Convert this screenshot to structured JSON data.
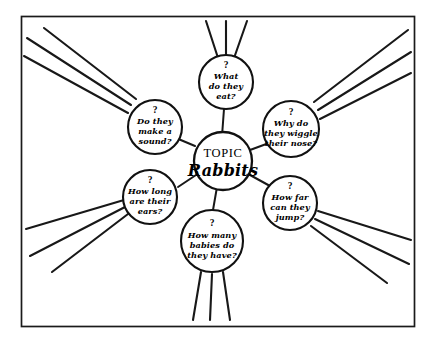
{
  "diagram": {
    "type": "spider-map",
    "frame": {
      "border_color": "#1a1a1a",
      "background": "#ffffff"
    },
    "ink_color": "#111111",
    "center": {
      "label": "TOPIC",
      "value": "Rabbits"
    },
    "question_marker": "?",
    "branches": [
      {
        "id": "top",
        "question_marker": "?",
        "lines": [
          "What",
          "do they",
          "eat?"
        ],
        "ray_count": 3
      },
      {
        "id": "upper-left",
        "question_marker": "?",
        "lines": [
          "Do they",
          "make a",
          "sound?"
        ],
        "ray_count": 3
      },
      {
        "id": "upper-right",
        "question_marker": "?",
        "lines": [
          "Why do",
          "they wiggle",
          "their nose?"
        ],
        "ray_count": 3
      },
      {
        "id": "lower-left",
        "question_marker": "?",
        "lines": [
          "How long",
          "are their",
          "ears?"
        ],
        "ray_count": 3
      },
      {
        "id": "lower-right",
        "question_marker": "?",
        "lines": [
          "How far",
          "can they",
          "jump?"
        ],
        "ray_count": 3
      },
      {
        "id": "bottom",
        "question_marker": "?",
        "lines": [
          "How many",
          "babies do",
          "they have?"
        ],
        "ray_count": 3
      }
    ]
  }
}
